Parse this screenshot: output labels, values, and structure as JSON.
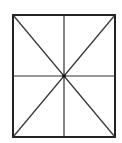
{
  "diagram": {
    "type": "rectangle-divided",
    "stroke_color": "#222222",
    "background": "#ffffff",
    "rect": {
      "x1": 13,
      "y1": 15,
      "x2": 115,
      "y2": 137
    },
    "center": {
      "x": 64,
      "y": 76
    },
    "lines": [
      {
        "name": "vertical-midline",
        "x1": 64,
        "y1": 15,
        "x2": 64,
        "y2": 137
      },
      {
        "name": "horizontal-midline",
        "x1": 13,
        "y1": 76,
        "x2": 115,
        "y2": 76
      },
      {
        "name": "diagonal-tl-br",
        "x1": 13,
        "y1": 15,
        "x2": 115,
        "y2": 137
      },
      {
        "name": "diagonal-tr-bl",
        "x1": 115,
        "y1": 15,
        "x2": 13,
        "y2": 137
      }
    ]
  }
}
